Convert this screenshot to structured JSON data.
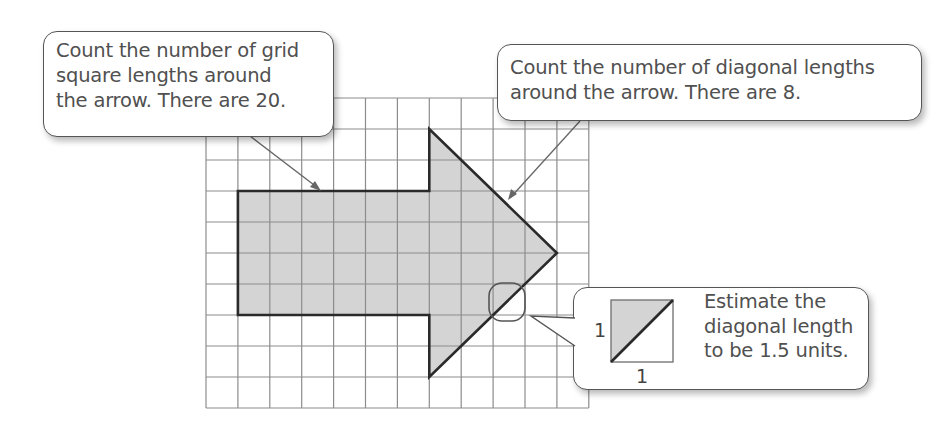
{
  "callouts": {
    "grid_lengths": {
      "lines": [
        "Count the number of grid",
        "square lengths around",
        "the arrow.  There are 20."
      ]
    },
    "diagonal_lengths": {
      "lines": [
        "Count the number of diagonal lengths",
        "around the arrow.  There are 8."
      ]
    },
    "estimate": {
      "lines": [
        "Estimate the",
        "diagonal length",
        "to be 1.5 units."
      ],
      "side_label_vertical": "1",
      "side_label_horizontal": "1"
    }
  },
  "grid": {
    "columns": 12,
    "rows": 10,
    "origin_x": 206,
    "origin_y": 98,
    "cell_w": 31.9,
    "cell_h": 31
  },
  "arrow": {
    "vertices_grid": [
      [
        1,
        3
      ],
      [
        7,
        3
      ],
      [
        7,
        1
      ],
      [
        11,
        5
      ],
      [
        7,
        9
      ],
      [
        7,
        7
      ],
      [
        1,
        7
      ]
    ],
    "fill": "#d4d4d4",
    "stroke": "#2a2a2a",
    "grid_square_lengths": 20,
    "diagonal_lengths": 8,
    "estimated_diagonal_length": 1.5
  },
  "colors": {
    "grid_line": "#8c8c8c",
    "arrow_fill": "#d4d4d4",
    "leader_line": "#555555"
  }
}
